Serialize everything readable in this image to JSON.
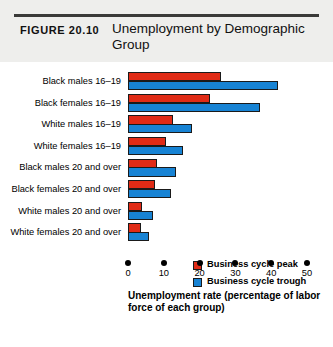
{
  "header": {
    "figure_number": "FIGURE 20.10",
    "title": "Unemployment by Demographic Group"
  },
  "legend": {
    "position": "inside-right",
    "entries": [
      {
        "label": "Business cycle peak",
        "color": "#e02b16"
      },
      {
        "label": "Business cycle trough",
        "color": "#1783d4"
      }
    ]
  },
  "axis": {
    "tick_labels": [
      "0",
      "10",
      "20",
      "30",
      "40",
      "50"
    ],
    "caption": "Unemployment rate (percentage of labor force of each group)"
  },
  "chart_data": {
    "type": "bar",
    "orientation": "horizontal",
    "title": "Unemployment by Demographic Group",
    "xlabel": "Unemployment rate (percentage of labor force of each group)",
    "ylabel": "",
    "xlim": [
      0,
      50
    ],
    "xticks": [
      0,
      10,
      20,
      30,
      40,
      50
    ],
    "grid": false,
    "legend_position": "inside-right",
    "categories": [
      "Black males 16–19",
      "Black females 16–19",
      "White males 16–19",
      "White females 16–19",
      "Black males 20 and over",
      "Black females 20 and over",
      "White males 20 and over",
      "White females 20 and over"
    ],
    "series": [
      {
        "name": "Business cycle peak",
        "color": "#e02b16",
        "values": [
          26.0,
          23.0,
          12.5,
          10.5,
          8.0,
          7.5,
          4.0,
          3.5
        ]
      },
      {
        "name": "Business cycle trough",
        "color": "#1783d4",
        "values": [
          42.0,
          37.0,
          18.0,
          15.5,
          13.5,
          12.0,
          7.0,
          6.0
        ]
      }
    ]
  }
}
